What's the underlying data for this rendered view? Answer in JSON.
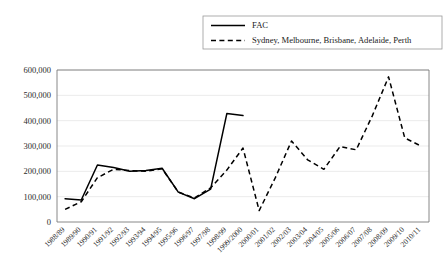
{
  "chart_data": {
    "type": "line",
    "title": "",
    "subtitle": "",
    "xlabel": "",
    "ylabel": "",
    "ylim": [
      0,
      600000
    ],
    "ytick_labels": [
      "0",
      "100,000",
      "200,000",
      "300,000",
      "400,000",
      "500,000",
      "600,000"
    ],
    "ytick_values": [
      0,
      100000,
      200000,
      300000,
      400000,
      500000,
      600000
    ],
    "grid": true,
    "legend_position": "top-right",
    "categories": [
      "1988/89",
      "1989/90",
      "1990/91",
      "1991/92",
      "1992/93",
      "1993/94",
      "1994/95",
      "1995/96",
      "1996/97",
      "1997/98",
      "1998/99",
      "1999/2000",
      "2000/01",
      "2001/02",
      "2002/03",
      "2003/04",
      "2004/05",
      "2005/06",
      "2006/07",
      "2007/08",
      "2008/09",
      "2009/10",
      "2010/11"
    ],
    "series": [
      {
        "name": "FAC",
        "style": "solid",
        "color": "#000000",
        "values": [
          92000,
          87000,
          225000,
          215000,
          200000,
          203000,
          212000,
          118000,
          92000,
          130000,
          428000,
          420000,
          null,
          null,
          null,
          null,
          null,
          null,
          null,
          null,
          null,
          null,
          null
        ]
      },
      {
        "name": "Sydney, Melbourne, Brisbane, Adelaide, Perth",
        "style": "dashed",
        "color": "#000000",
        "values": [
          50000,
          80000,
          175000,
          208000,
          203000,
          200000,
          210000,
          118000,
          95000,
          135000,
          205000,
          292000,
          45000,
          175000,
          320000,
          245000,
          208000,
          298000,
          285000,
          420000,
          573000,
          332000,
          300000
        ]
      }
    ]
  },
  "legend": {
    "entries": [
      {
        "label": "FAC",
        "style": "solid"
      },
      {
        "label": "Sydney, Melbourne, Brisbane, Adelaide, Perth",
        "style": "dashed"
      }
    ]
  }
}
